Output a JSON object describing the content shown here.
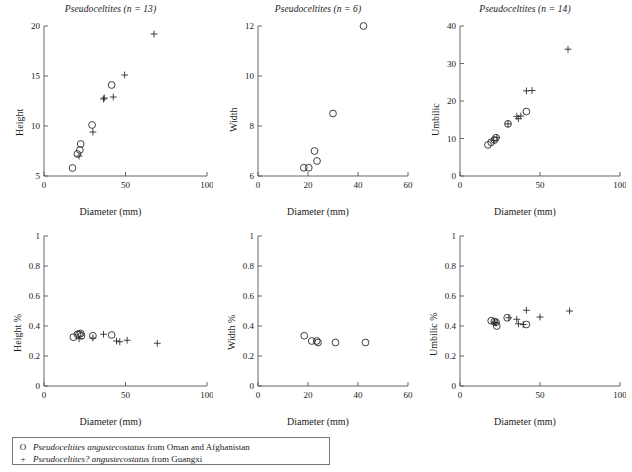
{
  "figure": {
    "background": "#ffffff",
    "marker_color": "#2b2b2b",
    "axis_color": "#555555"
  },
  "legend": {
    "rows": [
      {
        "symbol": "O",
        "symbol_name": "open-circle",
        "species": "Pseudoceltites angustecostatus",
        "locality": " from Oman and Afghanistan"
      },
      {
        "symbol": "+",
        "symbol_name": "plus-cross",
        "species": "Pseudoceltites? angustecostatus",
        "locality": " from Guangxi"
      }
    ]
  },
  "chart_data": [
    {
      "id": "height-vs-diameter",
      "type": "scatter",
      "title_genus": "Pseudoceltites",
      "title_n": "(n = 13)",
      "xlabel": "Diameter (mm)",
      "ylabel": "Height",
      "xlim": [
        0,
        100
      ],
      "ylim": [
        5,
        20
      ],
      "xticks": [
        0,
        50,
        100
      ],
      "yticks": [
        5,
        10,
        15,
        20
      ],
      "grid": false,
      "series": [
        {
          "name": "Pseudoceltites angustecostatus from Oman and Afghanistan",
          "marker": "circle",
          "points": [
            [
              17.5,
              5.8
            ],
            [
              20.5,
              7.2
            ],
            [
              22.0,
              7.6
            ],
            [
              22.5,
              8.2
            ],
            [
              29.5,
              10.1
            ],
            [
              41.5,
              14.1
            ]
          ]
        },
        {
          "name": "Pseudoceltites? angustecostatus from Guangxi",
          "marker": "plus",
          "points": [
            [
              21.5,
              7.0
            ],
            [
              30.0,
              9.4
            ],
            [
              36.5,
              12.7
            ],
            [
              37.0,
              12.8
            ],
            [
              42.5,
              12.9
            ],
            [
              49.5,
              15.1
            ],
            [
              67.5,
              19.2
            ]
          ]
        }
      ]
    },
    {
      "id": "width-vs-diameter",
      "type": "scatter",
      "title_genus": "Pseudoceltites",
      "title_n": "(n = 6)",
      "xlabel": "Diameter (mm)",
      "ylabel": "Width",
      "xlim": [
        0,
        60
      ],
      "ylim": [
        6,
        12
      ],
      "xticks": [
        0,
        20,
        40,
        60
      ],
      "yticks": [
        6,
        8,
        10,
        12
      ],
      "grid": false,
      "series": [
        {
          "name": "Pseudoceltites angustecostatus from Oman and Afghanistan",
          "marker": "circle",
          "points": [
            [
              18.3,
              6.33
            ],
            [
              20.3,
              6.33
            ],
            [
              22.6,
              7.0
            ],
            [
              23.6,
              6.6
            ],
            [
              30.0,
              8.5
            ],
            [
              42.2,
              12.0
            ]
          ]
        },
        {
          "name": "Pseudoceltites? angustecostatus from Guangxi",
          "marker": "plus",
          "points": []
        }
      ]
    },
    {
      "id": "umbilic-vs-diameter",
      "type": "scatter",
      "title_genus": "Pseudoceltites",
      "title_n": "(n = 14)",
      "xlabel": "Diameter (mm)",
      "ylabel": "Umbilic",
      "xlim": [
        0,
        100
      ],
      "ylim": [
        0,
        40
      ],
      "xticks": [
        0,
        50,
        100
      ],
      "yticks": [
        0,
        10,
        20,
        30,
        40
      ],
      "grid": false,
      "series": [
        {
          "name": "Pseudoceltites angustecostatus from Oman and Afghanistan",
          "marker": "circle",
          "points": [
            [
              17.5,
              8.3
            ],
            [
              19.5,
              9.0
            ],
            [
              21.5,
              9.6
            ],
            [
              22.5,
              10.2
            ],
            [
              30.0,
              13.9
            ],
            [
              41.5,
              17.2
            ]
          ]
        },
        {
          "name": "Pseudoceltites? angustecostatus from Guangxi",
          "marker": "plus",
          "points": [
            [
              21.0,
              9.5
            ],
            [
              23.0,
              10.3
            ],
            [
              30.0,
              13.9
            ],
            [
              35.5,
              15.9
            ],
            [
              36.5,
              15.3
            ],
            [
              38.0,
              16.0
            ],
            [
              41.5,
              22.7
            ],
            [
              45.0,
              22.8
            ],
            [
              67.5,
              33.8
            ]
          ]
        }
      ]
    },
    {
      "id": "height-percent-vs-diameter",
      "type": "scatter",
      "title_genus": "",
      "title_n": "",
      "xlabel": "Diameter (mm)",
      "ylabel": "Height %",
      "xlim": [
        0,
        100
      ],
      "ylim": [
        0,
        1
      ],
      "xticks": [
        0,
        50,
        100
      ],
      "yticks": [
        0,
        0.2,
        0.4,
        0.6,
        0.8,
        1
      ],
      "grid": false,
      "series": [
        {
          "name": "Pseudoceltites angustecostatus from Oman and Afghanistan",
          "marker": "circle",
          "points": [
            [
              18.0,
              0.325
            ],
            [
              20.5,
              0.345
            ],
            [
              21.5,
              0.345
            ],
            [
              22.5,
              0.35
            ],
            [
              23.0,
              0.335
            ],
            [
              30.0,
              0.335
            ],
            [
              41.5,
              0.34
            ]
          ]
        },
        {
          "name": "Pseudoceltites? angustecostatus from Guangxi",
          "marker": "plus",
          "points": [
            [
              21.5,
              0.315
            ],
            [
              30.0,
              0.32
            ],
            [
              36.5,
              0.345
            ],
            [
              44.5,
              0.3
            ],
            [
              46.5,
              0.295
            ],
            [
              51.0,
              0.305
            ],
            [
              69.5,
              0.285
            ]
          ]
        }
      ]
    },
    {
      "id": "width-percent-vs-diameter",
      "type": "scatter",
      "title_genus": "",
      "title_n": "",
      "xlabel": "Diameter (mm)",
      "ylabel": "Width %",
      "xlim": [
        0,
        60
      ],
      "ylim": [
        0,
        1
      ],
      "xticks": [
        0,
        20,
        40,
        60
      ],
      "yticks": [
        0,
        0.2,
        0.4,
        0.6,
        0.8,
        1
      ],
      "grid": false,
      "series": [
        {
          "name": "Pseudoceltites angustecostatus from Oman and Afghanistan",
          "marker": "circle",
          "points": [
            [
              18.5,
              0.335
            ],
            [
              21.5,
              0.3
            ],
            [
              23.5,
              0.3
            ],
            [
              24.0,
              0.29
            ],
            [
              31.0,
              0.29
            ],
            [
              43.0,
              0.29
            ]
          ]
        },
        {
          "name": "Pseudoceltites? angustecostatus from Guangxi",
          "marker": "plus",
          "points": []
        }
      ]
    },
    {
      "id": "umbilic-percent-vs-diameter",
      "type": "scatter",
      "title_genus": "",
      "title_n": "",
      "xlabel": "Diameter (mm)",
      "ylabel": "Umbilic %",
      "xlim": [
        0,
        100
      ],
      "ylim": [
        0,
        1
      ],
      "xticks": [
        0,
        50,
        100
      ],
      "yticks": [
        0,
        0.2,
        0.4,
        0.6,
        0.8,
        1
      ],
      "grid": false,
      "series": [
        {
          "name": "Pseudoceltites angustecostatus from Oman and Afghanistan",
          "marker": "circle",
          "points": [
            [
              19.5,
              0.435
            ],
            [
              21.5,
              0.43
            ],
            [
              22.5,
              0.425
            ],
            [
              23.0,
              0.4
            ],
            [
              29.5,
              0.455
            ],
            [
              41.5,
              0.41
            ]
          ]
        },
        {
          "name": "Pseudoceltites? angustecostatus from Guangxi",
          "marker": "plus",
          "points": [
            [
              21.5,
              0.425
            ],
            [
              22.5,
              0.42
            ],
            [
              30.5,
              0.455
            ],
            [
              35.5,
              0.445
            ],
            [
              36.5,
              0.415
            ],
            [
              39.5,
              0.41
            ],
            [
              41.5,
              0.505
            ],
            [
              50.0,
              0.46
            ],
            [
              68.5,
              0.5
            ]
          ]
        }
      ]
    }
  ]
}
